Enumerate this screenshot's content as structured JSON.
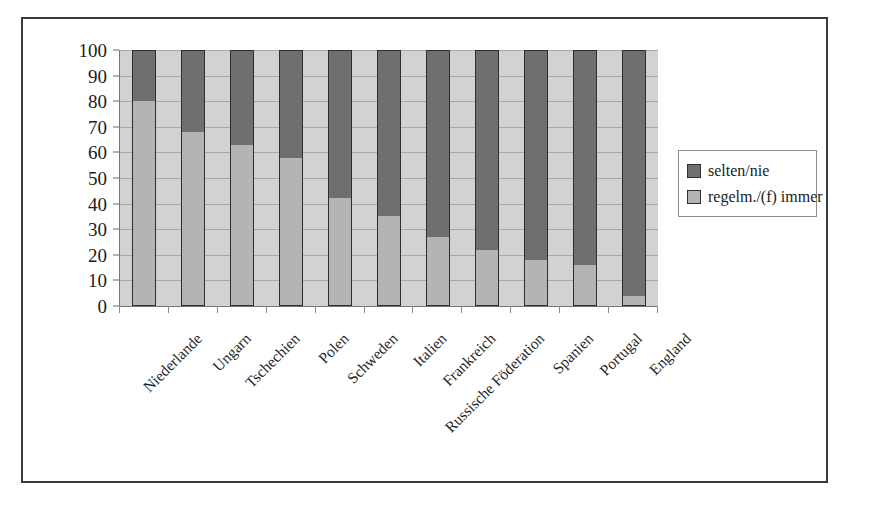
{
  "chart_data": {
    "type": "bar",
    "subtype": "stacked-100-percent-vertical",
    "title": "",
    "subtitle": "",
    "xlabel": "",
    "ylabel": "",
    "ylim": [
      0,
      100
    ],
    "y_ticks": [
      0,
      10,
      20,
      30,
      40,
      50,
      60,
      70,
      80,
      90,
      100
    ],
    "grid": true,
    "legend_position": "right",
    "categories": [
      "Niederlande",
      "Ungarn",
      "Tschechien",
      "Polen",
      "Schweden",
      "Italien",
      "Frankreich",
      "Russische Föderation",
      "Spanien",
      "Portugal",
      "England"
    ],
    "series": [
      {
        "name": "selten/nie",
        "color": "#6f6f6f",
        "values": [
          20,
          32,
          37,
          42,
          58,
          65,
          73,
          78,
          82,
          84,
          96
        ]
      },
      {
        "name": "regelm./(f) immer",
        "color": "#b4b4b4",
        "values": [
          80,
          68,
          63,
          58,
          42,
          35,
          27,
          22,
          18,
          16,
          4
        ]
      }
    ]
  },
  "legend": {
    "items": [
      {
        "label": "selten/nie",
        "swatch": "dark"
      },
      {
        "label": "regelm./(f) immer",
        "swatch": "light"
      }
    ]
  },
  "axis": {
    "y_tick_labels": [
      "100",
      "90",
      "80",
      "70",
      "60",
      "50",
      "40",
      "30",
      "20",
      "10",
      "0"
    ]
  }
}
